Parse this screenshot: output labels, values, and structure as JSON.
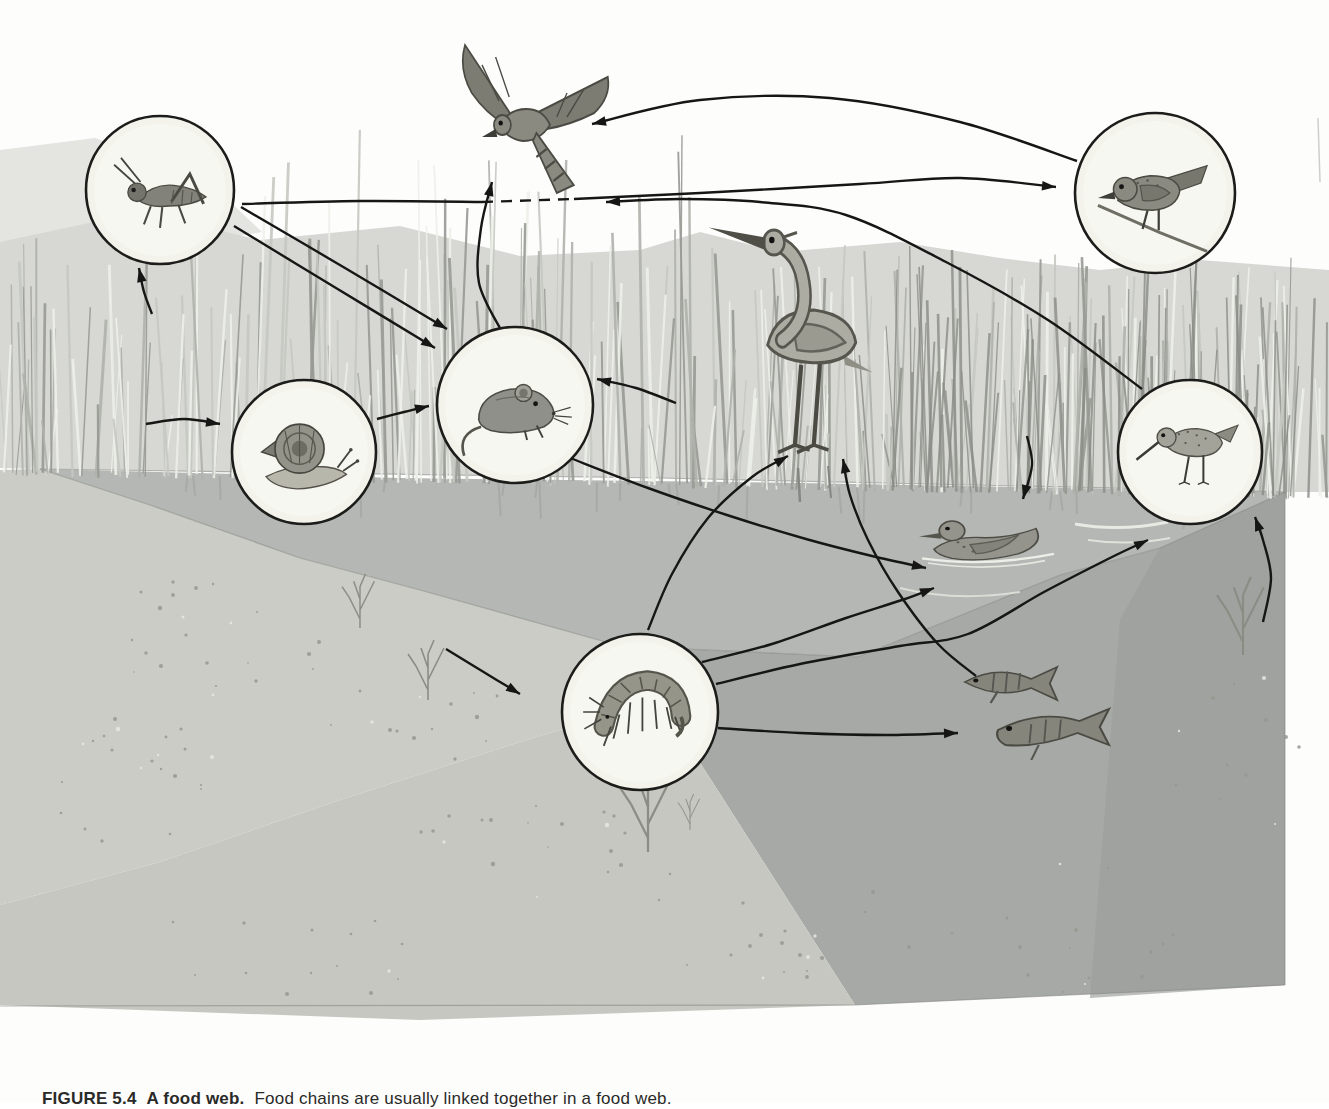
{
  "figure": {
    "caption_label": "FIGURE 5.4",
    "caption_title": "A food web.",
    "caption_text": "Food chains are usually linked together in a food web."
  },
  "palette": {
    "page_background": "#ffffff",
    "arrow_color": "#161614",
    "circle_fill": "#f3f3ec",
    "circle_stroke": "#1c1c1a",
    "grass_band": "#d7d8d3",
    "upper_wash": "#e4e5e0",
    "water_surface": "#b4b7b3",
    "left_bank_sand": "#cbccc6",
    "underwater_body": "#a6a9a5",
    "underwater_right_shade": "#9b9e9a",
    "sandy_floor": "#c6c7c1",
    "edge_line": "#82847e"
  },
  "diagram": {
    "nodes": [
      {
        "id": "grasshopper",
        "name": "grasshopper",
        "icon": "grasshopper-icon",
        "circled": true,
        "x": 160,
        "y": 190,
        "r": 74
      },
      {
        "id": "hawk",
        "name": "hawk",
        "icon": "hawk-icon",
        "circled": false,
        "x": 533,
        "y": 125,
        "w": 170,
        "h": 200
      },
      {
        "id": "songbird",
        "name": "songbird",
        "icon": "songbird-icon",
        "circled": true,
        "x": 1155,
        "y": 193,
        "r": 80
      },
      {
        "id": "snail",
        "name": "snail",
        "icon": "snail-icon",
        "circled": true,
        "x": 304,
        "y": 452,
        "r": 72
      },
      {
        "id": "mouse",
        "name": "mouse",
        "icon": "mouse-icon",
        "circled": true,
        "x": 515,
        "y": 405,
        "r": 78
      },
      {
        "id": "heron",
        "name": "heron",
        "icon": "heron-icon",
        "circled": false,
        "x": 797,
        "y": 335,
        "w": 210,
        "h": 250
      },
      {
        "id": "duck",
        "name": "duck",
        "icon": "duck-icon",
        "circled": false,
        "x": 988,
        "y": 540,
        "w": 150,
        "h": 115
      },
      {
        "id": "sandpiper",
        "name": "sandpiper",
        "icon": "sandpiper-icon",
        "circled": true,
        "x": 1190,
        "y": 452,
        "r": 72
      },
      {
        "id": "amphipod",
        "name": "amphipod",
        "icon": "amphipod-icon",
        "circled": true,
        "x": 640,
        "y": 712,
        "r": 78
      },
      {
        "id": "fish",
        "name": "fish",
        "icon": "fish-icon",
        "circled": false,
        "x": 1035,
        "y": 712,
        "w": 185,
        "h": 150
      },
      {
        "id": "plants",
        "name": "marsh-plants",
        "icon": "plants-scene",
        "circled": false,
        "scene_only": true
      }
    ],
    "edges": [
      {
        "from": "plants",
        "to": "grasshopper",
        "pts": [
          [
            152,
            314
          ],
          [
            144,
            292
          ],
          [
            139,
            268
          ]
        ]
      },
      {
        "from": "plants",
        "to": "snail",
        "pts": [
          [
            146,
            424
          ],
          [
            184,
            419
          ],
          [
            220,
            424
          ]
        ]
      },
      {
        "from": "plants",
        "to": "mouse",
        "pts": [
          [
            676,
            403
          ],
          [
            636,
            388
          ],
          [
            597,
            379
          ]
        ]
      },
      {
        "from": "grasshopper",
        "to": "mouse",
        "line": 1,
        "pts": [
          [
            241,
            207
          ],
          [
            345,
            268
          ],
          [
            447,
            329
          ]
        ]
      },
      {
        "from": "grasshopper",
        "to": "mouse",
        "line": 2,
        "pts": [
          [
            234,
            226
          ],
          [
            336,
            288
          ],
          [
            435,
            348
          ]
        ]
      },
      {
        "from": "grasshopper",
        "to": "songbird",
        "part": 1,
        "arrow": false,
        "pts": [
          [
            242,
            204
          ],
          [
            360,
            201
          ],
          [
            482,
            202
          ]
        ]
      },
      {
        "from": "grasshopper",
        "to": "songbird",
        "part": 2,
        "arrow": false,
        "dash": true,
        "note": "dashed where it passes the hawk",
        "pts": [
          [
            482,
            202
          ],
          [
            574,
            199
          ]
        ]
      },
      {
        "from": "grasshopper",
        "to": "songbird",
        "part": 3,
        "pts": [
          [
            574,
            199
          ],
          [
            700,
            193
          ],
          [
            860,
            184
          ],
          [
            960,
            178
          ],
          [
            1056,
            187
          ]
        ]
      },
      {
        "from": "snail",
        "to": "mouse",
        "pts": [
          [
            377,
            419
          ],
          [
            404,
            412
          ],
          [
            429,
            406
          ]
        ]
      },
      {
        "from": "mouse",
        "to": "hawk",
        "pts": [
          [
            502,
            332
          ],
          [
            479,
            283
          ],
          [
            481,
            228
          ],
          [
            492,
            182
          ]
        ]
      },
      {
        "from": "songbird",
        "to": "hawk",
        "pts": [
          [
            1077,
            161
          ],
          [
            960,
            122
          ],
          [
            830,
            98
          ],
          [
            700,
            100
          ],
          [
            592,
            124
          ]
        ]
      },
      {
        "from": "sandpiper",
        "to": "hawk",
        "pts": [
          [
            1142,
            389
          ],
          [
            1048,
            320
          ],
          [
            946,
            262
          ],
          [
            846,
            215
          ],
          [
            760,
            202
          ],
          [
            680,
            199
          ],
          [
            606,
            202
          ]
        ]
      },
      {
        "from": "mouse",
        "to": "duck",
        "pts": [
          [
            570,
            458
          ],
          [
            648,
            488
          ],
          [
            730,
            516
          ],
          [
            806,
            539
          ],
          [
            872,
            556
          ],
          [
            926,
            568
          ]
        ]
      },
      {
        "from": "plants",
        "to": "duck",
        "pts": [
          [
            1027,
            436
          ],
          [
            1032,
            465
          ],
          [
            1023,
            499
          ]
        ]
      },
      {
        "from": "amphipod",
        "to": "heron",
        "pts": [
          [
            648,
            630
          ],
          [
            672,
            574
          ],
          [
            708,
            518
          ],
          [
            752,
            477
          ],
          [
            788,
            456
          ]
        ]
      },
      {
        "from": "fish",
        "to": "heron",
        "pts": [
          [
            976,
            676
          ],
          [
            938,
            644
          ],
          [
            898,
            592
          ],
          [
            868,
            540
          ],
          [
            850,
            495
          ],
          [
            843,
            459
          ]
        ]
      },
      {
        "from": "amphipod",
        "to": "duck",
        "pts": [
          [
            702,
            662
          ],
          [
            772,
            644
          ],
          [
            846,
            618
          ],
          [
            902,
            600
          ],
          [
            934,
            588
          ]
        ]
      },
      {
        "from": "amphipod",
        "to": "sandpiper",
        "pts": [
          [
            716,
            684
          ],
          [
            800,
            664
          ],
          [
            900,
            646
          ],
          [
            968,
            634
          ],
          [
            1044,
            592
          ],
          [
            1110,
            558
          ],
          [
            1148,
            540
          ]
        ]
      },
      {
        "from": "amphipod",
        "to": "fish",
        "pts": [
          [
            718,
            728
          ],
          [
            800,
            733
          ],
          [
            886,
            735
          ],
          [
            958,
            733
          ]
        ]
      },
      {
        "from": "plants",
        "to": "amphipod",
        "pts": [
          [
            446,
            649
          ],
          [
            482,
            671
          ],
          [
            520,
            694
          ]
        ]
      },
      {
        "from": "plants",
        "to": "sandpiper",
        "pts": [
          [
            1263,
            622
          ],
          [
            1271,
            578
          ],
          [
            1263,
            540
          ],
          [
            1255,
            517
          ]
        ]
      }
    ]
  },
  "scene": {
    "regions": [
      {
        "name": "sky",
        "fill": "#fdfdfc",
        "pts": [
          [
            0,
            0
          ],
          [
            1329,
            0
          ],
          [
            1329,
            1103
          ],
          [
            0,
            1103
          ]
        ]
      },
      {
        "name": "upper-left-wash",
        "fill": "#e4e5e0",
        "pts": [
          [
            0,
            150
          ],
          [
            95,
            138
          ],
          [
            205,
            178
          ],
          [
            262,
            232
          ],
          [
            150,
            252
          ],
          [
            0,
            248
          ]
        ]
      },
      {
        "name": "grass-band",
        "fill": "#d7d8d3",
        "pts": [
          [
            0,
            242
          ],
          [
            140,
            212
          ],
          [
            260,
            240
          ],
          [
            400,
            226
          ],
          [
            520,
            256
          ],
          [
            640,
            250
          ],
          [
            700,
            232
          ],
          [
            780,
            252
          ],
          [
            900,
            242
          ],
          [
            1000,
            258
          ],
          [
            1100,
            270
          ],
          [
            1200,
            260
          ],
          [
            1329,
            270
          ],
          [
            1329,
            492
          ],
          [
            1285,
            492
          ],
          [
            660,
            478
          ],
          [
            40,
            469
          ],
          [
            0,
            468
          ]
        ]
      },
      {
        "name": "water-surface",
        "fill": "#b4b7b3",
        "pts": [
          [
            40,
            469
          ],
          [
            400,
            478
          ],
          [
            800,
            483
          ],
          [
            1285,
            492
          ],
          [
            1160,
            548
          ],
          [
            1060,
            575
          ],
          [
            858,
            657
          ],
          [
            620,
            646
          ],
          [
            420,
            590
          ],
          [
            300,
            558
          ],
          [
            150,
            505
          ]
        ]
      },
      {
        "name": "left-bank-sand",
        "fill": "#cbccc6",
        "pts": [
          [
            0,
            470
          ],
          [
            40,
            469
          ],
          [
            150,
            505
          ],
          [
            300,
            558
          ],
          [
            420,
            590
          ],
          [
            620,
            646
          ],
          [
            660,
            700
          ],
          [
            520,
            742
          ],
          [
            340,
            800
          ],
          [
            160,
            862
          ],
          [
            0,
            905
          ]
        ]
      },
      {
        "name": "underwater-body",
        "fill": "#a6a9a5",
        "pts": [
          [
            620,
            646
          ],
          [
            858,
            657
          ],
          [
            1060,
            575
          ],
          [
            1160,
            548
          ],
          [
            1285,
            492
          ],
          [
            1285,
            985
          ],
          [
            855,
            1005
          ],
          [
            660,
            700
          ]
        ]
      },
      {
        "name": "underwater-right-shade",
        "fill": "#9b9e9a",
        "opacity": 0.65,
        "pts": [
          [
            1160,
            548
          ],
          [
            1285,
            492
          ],
          [
            1285,
            985
          ],
          [
            1090,
            998
          ],
          [
            1120,
            620
          ]
        ]
      },
      {
        "name": "sandy-floor",
        "fill": "#c6c7c1",
        "pts": [
          [
            0,
            905
          ],
          [
            160,
            862
          ],
          [
            340,
            800
          ],
          [
            520,
            742
          ],
          [
            660,
            700
          ],
          [
            855,
            1005
          ],
          [
            420,
            1020
          ],
          [
            0,
            1005
          ]
        ]
      }
    ],
    "block_edges": [
      {
        "name": "waterline",
        "pts": [
          [
            40,
            469
          ],
          [
            660,
            478
          ],
          [
            1285,
            492
          ]
        ]
      },
      {
        "name": "surface-front-edge",
        "pts": [
          [
            40,
            469
          ],
          [
            150,
            505
          ],
          [
            300,
            558
          ],
          [
            420,
            590
          ],
          [
            620,
            646
          ],
          [
            858,
            657
          ],
          [
            1060,
            575
          ],
          [
            1160,
            548
          ],
          [
            1285,
            492
          ]
        ]
      },
      {
        "name": "right-cut-edge",
        "pts": [
          [
            1285,
            492
          ],
          [
            1285,
            985
          ]
        ]
      },
      {
        "name": "bottom-right-edge",
        "pts": [
          [
            855,
            1005
          ],
          [
            1285,
            985
          ]
        ]
      },
      {
        "name": "bottom-left-edge",
        "pts": [
          [
            0,
            1006
          ],
          [
            855,
            1005
          ]
        ]
      }
    ],
    "reeds": {
      "count": 330,
      "dark_count": 70,
      "colors": [
        "#eef0ea",
        "#c6c8c2",
        "#b0b2ac",
        "#989a94"
      ],
      "dark_color": "#8a8c86"
    },
    "sprigs": [
      {
        "x": 360,
        "y": 628,
        "s": 0.9
      },
      {
        "x": 428,
        "y": 700,
        "s": 1.0
      },
      {
        "x": 648,
        "y": 852,
        "s": 1.4
      },
      {
        "x": 1243,
        "y": 655,
        "s": 1.3
      },
      {
        "x": 690,
        "y": 830,
        "s": 0.6
      }
    ],
    "speckle_clusters": [
      {
        "cx": 200,
        "cy": 640,
        "rx": 130,
        "ry": 60,
        "n": 22
      },
      {
        "cx": 120,
        "cy": 780,
        "rx": 110,
        "ry": 70,
        "n": 22
      },
      {
        "cx": 420,
        "cy": 720,
        "rx": 90,
        "ry": 50,
        "n": 14
      },
      {
        "cx": 520,
        "cy": 860,
        "rx": 160,
        "ry": 60,
        "n": 20
      },
      {
        "cx": 780,
        "cy": 930,
        "rx": 150,
        "ry": 60,
        "n": 18
      },
      {
        "cx": 1050,
        "cy": 930,
        "rx": 150,
        "ry": 70,
        "n": 16
      },
      {
        "cx": 1240,
        "cy": 760,
        "rx": 70,
        "ry": 90,
        "n": 12
      },
      {
        "cx": 300,
        "cy": 950,
        "rx": 160,
        "ry": 50,
        "n": 14
      }
    ],
    "water_marks": [
      {
        "d": "M1075,524 Q1120,532 1168,522",
        "s": "#edeee8",
        "w": 3
      },
      {
        "d": "M1088,540 Q1130,546 1170,538",
        "s": "#e4e6df",
        "w": 2
      },
      {
        "d": "M900,588 Q955,602 1020,592",
        "s": "#dfe1da",
        "w": 2
      },
      {
        "d": "M798,468 L800,502",
        "s": "#7f827d",
        "w": 2.5
      },
      {
        "d": "M828,466 L831,498",
        "s": "#7f827d",
        "w": 2
      },
      {
        "d": "M1318,118 L1320,182",
        "s": "#c9c9c4",
        "w": 1.5
      }
    ]
  }
}
